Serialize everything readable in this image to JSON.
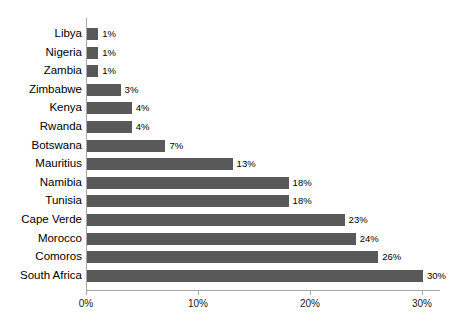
{
  "chart_data": {
    "type": "bar",
    "orientation": "horizontal",
    "title": "",
    "subtitle": "",
    "xlabel": "",
    "ylabel": "",
    "xlim": [
      0,
      31.6
    ],
    "grid": false,
    "legend": null,
    "bar_color": "#595959",
    "axis_color": "#a8a8a8",
    "text_color": "#000000",
    "x_ticks": [
      {
        "value": 0,
        "label": "0%"
      },
      {
        "value": 10,
        "label": "10%"
      },
      {
        "value": 20,
        "label": "20%"
      },
      {
        "value": 30,
        "label": "30%"
      }
    ],
    "categories": [
      "Libya",
      "Nigeria",
      "Zambia",
      "Zimbabwe",
      "Kenya",
      "Rwanda",
      "Botswana",
      "Mauritius",
      "Namibia",
      "Tunisia",
      "Cape Verde",
      "Morocco",
      "Comoros",
      "South Africa"
    ],
    "values": [
      1,
      1,
      1,
      3,
      4,
      4,
      7,
      13,
      18,
      18,
      23,
      24,
      26,
      30
    ],
    "data_labels": [
      "1%",
      "1%",
      "1%",
      "3%",
      "4%",
      "4%",
      "7%",
      "13%",
      "18%",
      "18%",
      "23%",
      "24%",
      "26%",
      "30%"
    ]
  }
}
